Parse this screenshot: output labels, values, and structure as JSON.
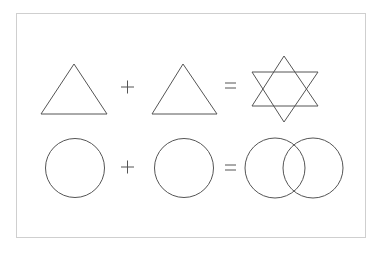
{
  "diagram": {
    "title": "",
    "stroke_color": "#555555",
    "frame_color": "#cfcfcf",
    "rows": [
      {
        "name": "triangles",
        "operands": [
          "triangle",
          "triangle"
        ],
        "operator": "+",
        "equals": "=",
        "result": "hexagram (six-pointed star)"
      },
      {
        "name": "circles",
        "operands": [
          "circle",
          "circle"
        ],
        "operator": "+",
        "equals": "=",
        "result": "two overlapping circles (Venn)"
      }
    ]
  }
}
